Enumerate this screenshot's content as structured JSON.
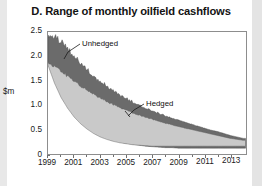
{
  "chart_data": {
    "type": "area",
    "title": "D. Range of monthly oilfield cashflows",
    "xlabel": "",
    "ylabel": "$m",
    "ylim": [
      0,
      2.5
    ],
    "xlim": [
      1999,
      2014.2
    ],
    "grid": false,
    "legend_position": "inline-annotations",
    "y_ticks": [
      "0",
      "0.5",
      "1.0",
      "1.5",
      "2.0",
      "2.5"
    ],
    "y_tick_values": [
      0,
      0.5,
      1.0,
      1.5,
      2.0,
      2.5
    ],
    "x_ticks": [
      "1999",
      "2001",
      "2003",
      "2005",
      "2007",
      "2009",
      "2011",
      "2013"
    ],
    "x_tick_values": [
      1999,
      2001,
      2003,
      2005,
      2007,
      2009,
      2011,
      2013
    ],
    "annotations": [
      {
        "text": "Unhedged",
        "x": 2001.0,
        "y": 2.12
      },
      {
        "text": "Hedged",
        "x": 2006.8,
        "y": 0.92
      }
    ],
    "colors": {
      "unhedged_band": "#6b6b6b",
      "hedged_band": "#c9c9c9",
      "axis": "#8d8d8d",
      "text": "#131313",
      "background": "#ffffff",
      "edge_strip": "#e8e8e8"
    },
    "series": [
      {
        "name": "Unhedged",
        "type": "band",
        "fill": "#6b6b6b",
        "x": [
          1999.0,
          1999.5,
          2000.0,
          2000.5,
          2001.0,
          2001.5,
          2002.0,
          2002.5,
          2003.0,
          2003.5,
          2004.0,
          2004.5,
          2005.0,
          2005.5,
          2006.0,
          2006.5,
          2007.0,
          2007.5,
          2008.0,
          2008.5,
          2009.0,
          2009.5,
          2010.0,
          2010.5,
          2011.0,
          2011.5,
          2012.0,
          2012.5,
          2013.0,
          2013.5,
          2014.0
        ],
        "upper": [
          2.44,
          2.4,
          2.28,
          2.13,
          1.98,
          1.84,
          1.71,
          1.59,
          1.48,
          1.38,
          1.29,
          1.21,
          1.13,
          1.06,
          1.0,
          0.94,
          0.88,
          0.83,
          0.78,
          0.73,
          0.69,
          0.65,
          0.61,
          0.57,
          0.53,
          0.49,
          0.46,
          0.42,
          0.38,
          0.35,
          0.32
        ],
        "lower": [
          1.86,
          1.53,
          1.25,
          1.03,
          0.85,
          0.7,
          0.58,
          0.48,
          0.4,
          0.34,
          0.29,
          0.25,
          0.22,
          0.2,
          0.18,
          0.16,
          0.15,
          0.14,
          0.13,
          0.13,
          0.12,
          0.12,
          0.12,
          0.12,
          0.12,
          0.12,
          0.12,
          0.12,
          0.12,
          0.12,
          0.12
        ]
      },
      {
        "name": "Hedged",
        "type": "band",
        "fill": "#c9c9c9",
        "x": [
          1999.0,
          1999.5,
          2000.0,
          2000.5,
          2001.0,
          2001.5,
          2002.0,
          2002.5,
          2003.0,
          2003.5,
          2004.0,
          2004.5,
          2005.0,
          2005.5,
          2006.0,
          2006.5,
          2007.0,
          2007.5,
          2008.0,
          2008.5,
          2009.0,
          2009.5,
          2010.0,
          2010.5,
          2011.0,
          2011.5,
          2012.0,
          2012.5,
          2013.0,
          2013.5,
          2014.0
        ],
        "upper": [
          1.86,
          1.78,
          1.68,
          1.58,
          1.48,
          1.39,
          1.3,
          1.22,
          1.14,
          1.07,
          1.01,
          0.95,
          0.89,
          0.84,
          0.79,
          0.75,
          0.71,
          0.67,
          0.63,
          0.6,
          0.56,
          0.53,
          0.5,
          0.47,
          0.44,
          0.41,
          0.38,
          0.35,
          0.32,
          0.3,
          0.28
        ],
        "lower": [
          1.82,
          1.45,
          1.16,
          0.94,
          0.76,
          0.62,
          0.51,
          0.42,
          0.35,
          0.3,
          0.26,
          0.23,
          0.21,
          0.19,
          0.18,
          0.17,
          0.16,
          0.16,
          0.16,
          0.16,
          0.16,
          0.16,
          0.16,
          0.16,
          0.16,
          0.16,
          0.16,
          0.16,
          0.16,
          0.16,
          0.16
        ]
      }
    ]
  }
}
